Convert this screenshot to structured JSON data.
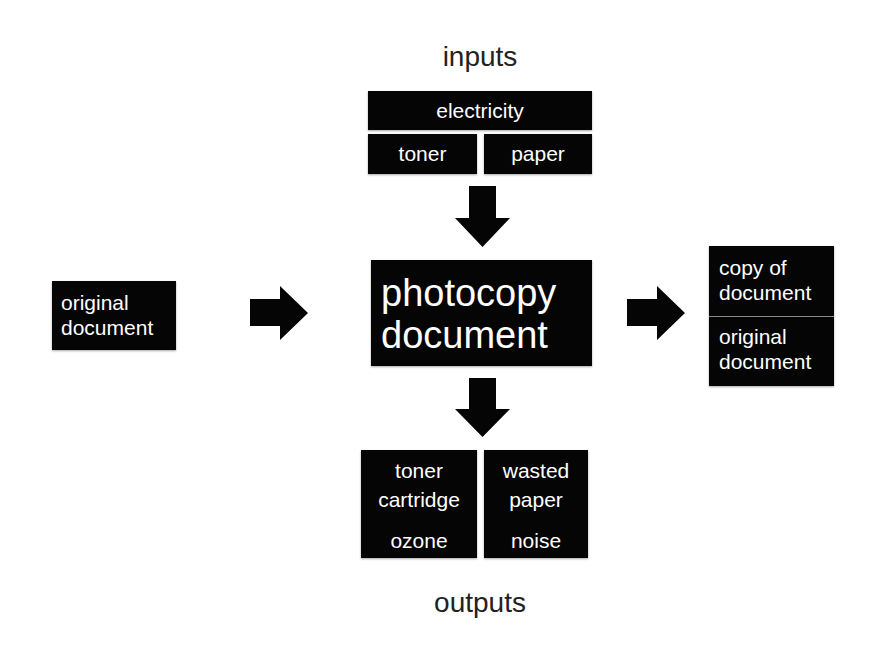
{
  "diagram": {
    "type": "process-flow",
    "colors": {
      "box_fill": "#050505",
      "box_text": "#ffffff",
      "label_text": "#222222",
      "arrow_fill": "#050505",
      "divider": "#8a8a8a"
    },
    "labels": {
      "inputs": "inputs",
      "outputs": "outputs"
    },
    "inputs": {
      "top": "electricity",
      "left": "toner",
      "right": "paper"
    },
    "process": {
      "lines": [
        "photocopy",
        "document"
      ]
    },
    "source": {
      "lines": [
        "original",
        "document"
      ]
    },
    "products": {
      "top": [
        "copy of",
        "document"
      ],
      "bottom": [
        "original",
        "document"
      ]
    },
    "outputs": {
      "left": [
        "toner",
        "cartridge",
        "ozone"
      ],
      "right": [
        "wasted",
        "paper",
        "noise"
      ]
    },
    "arrows": [
      {
        "id": "inputs-to-process",
        "direction": "down"
      },
      {
        "id": "process-to-outputs",
        "direction": "down"
      },
      {
        "id": "source-to-process",
        "direction": "right"
      },
      {
        "id": "process-to-products",
        "direction": "right"
      }
    ]
  }
}
